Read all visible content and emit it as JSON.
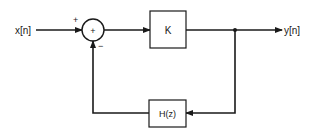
{
  "diagram": {
    "type": "feedback-block-diagram",
    "input": {
      "label": "x[n]"
    },
    "output": {
      "label": "y[n]"
    },
    "summer": {
      "symbol": "+",
      "input_signs": {
        "forward": "+",
        "feedback": "−"
      }
    },
    "forward_block": {
      "label": "K"
    },
    "feedback_block": {
      "label": "H(z)"
    },
    "colors": {
      "stroke": "#1a1a1a",
      "background": "#ffffff"
    }
  }
}
